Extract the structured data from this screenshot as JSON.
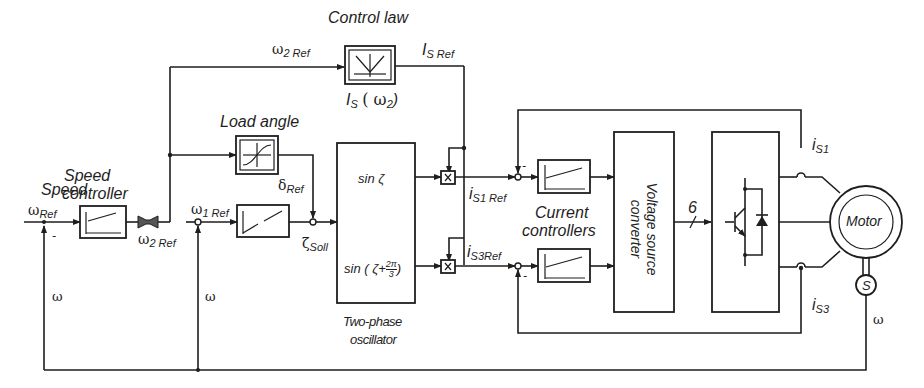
{
  "diagram": {
    "blocks": {
      "speed_controller": {
        "label_line1": "Speed",
        "label_line2": "controller"
      },
      "control_law": {
        "label": "Control law",
        "sub_label_main": "I",
        "sub_label_sub": "S",
        "sub_label_arg": "( ω",
        "sub_label_arg_sub": "2",
        "sub_label_end": ")"
      },
      "load_angle": {
        "label": "Load angle"
      },
      "oscillator": {
        "label_line1": "Two-phase",
        "label_line2": "oscillator",
        "out1": "sin  ζ",
        "out2_prefix": "sin ( ζ+",
        "out2_frac_num": "2π",
        "out2_frac_den": "3",
        "out2_suffix": ")"
      },
      "current_controllers": {
        "label_line1": "Current",
        "label_line2": "controllers"
      },
      "vsc": {
        "label_line1": "Voltage source",
        "label_line2": "converter"
      },
      "bus_width": "6",
      "motor": {
        "label": "Motor"
      },
      "sensor": {
        "label": "S"
      }
    },
    "signals": {
      "omega_ref": {
        "main": "ω",
        "sub": "Ref"
      },
      "omega2_ref_bottom": {
        "main": "ω",
        "sub": "2 Ref"
      },
      "omega2_ref_top": {
        "main": "ω",
        "sub": "2 Ref"
      },
      "omega1_ref": {
        "main": "ω",
        "sub": "1 Ref"
      },
      "is_ref": {
        "main": "I",
        "sub": "S Ref"
      },
      "delta_ref": {
        "main": "δ",
        "sub": "Ref"
      },
      "zeta_soll": {
        "main": "ζ",
        "sub": "Soll"
      },
      "is1_ref": {
        "main": "i",
        "sub": "S1 Ref"
      },
      "is3_ref": {
        "main": "i",
        "sub": "S3Ref"
      },
      "is1": {
        "main": "i",
        "sub": "S1"
      },
      "is3": {
        "main": "i",
        "sub": "S3"
      },
      "omega_fb1": "ω",
      "omega_fb2": "ω",
      "omega_motor": "ω",
      "minus": "-"
    },
    "colors": {
      "ink": "#1e1e1e",
      "background": "#ffffff"
    }
  }
}
